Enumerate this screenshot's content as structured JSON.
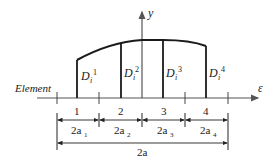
{
  "diagram": {
    "axes": {
      "x_label": "ε",
      "y_label": "y"
    },
    "element_label": "Element",
    "strips": [
      {
        "label": "D",
        "sub": "i",
        "sup": "1"
      },
      {
        "label": "D",
        "sub": "i",
        "sup": "2"
      },
      {
        "label": "D",
        "sub": "i",
        "sup": "3"
      },
      {
        "label": "D",
        "sub": "i",
        "sup": "4"
      }
    ],
    "elements": [
      "1",
      "2",
      "3",
      "4"
    ],
    "element_widths": [
      {
        "base": "2a",
        "sub": "1"
      },
      {
        "base": "2a",
        "sub": "2"
      },
      {
        "base": "2a",
        "sub": "3"
      },
      {
        "base": "2a",
        "sub": "4"
      }
    ],
    "total_width": "2a",
    "colors": {
      "line": "#222222",
      "curve": "#1a1a1a",
      "axis": "#555555"
    }
  }
}
